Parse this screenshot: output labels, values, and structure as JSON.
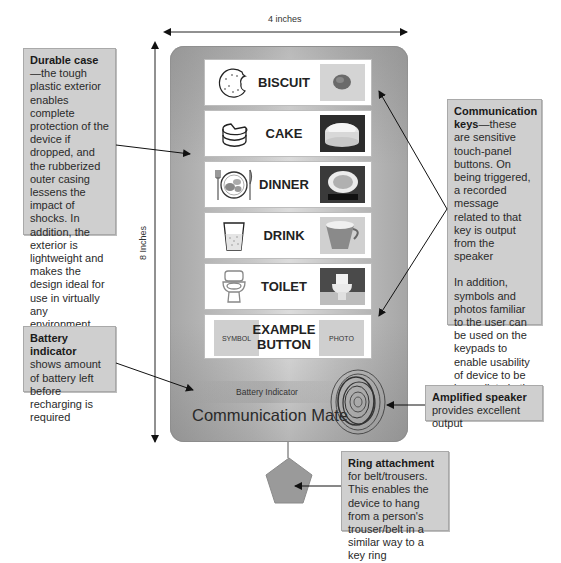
{
  "dimensions": {
    "width_label": "4 inches",
    "height_label": "8 Inches"
  },
  "device": {
    "name": "Communication Mate",
    "battery_label": "Battery Indicator",
    "keys": [
      {
        "label": "BISCUIT",
        "symbol": "biscuit-symbol",
        "photo": "biscuit-photo"
      },
      {
        "label": "CAKE",
        "symbol": "cake-symbol",
        "photo": "cake-photo"
      },
      {
        "label": "DINNER",
        "symbol": "dinner-symbol",
        "photo": "dinner-photo"
      },
      {
        "label": "DRINK",
        "symbol": "drink-symbol",
        "photo": "cup-photo"
      },
      {
        "label": "TOILET",
        "symbol": "toilet-symbol",
        "photo": "toilet-photo"
      },
      {
        "label_line1": "EXAMPLE",
        "label_line2": "BUTTON",
        "symbol_box": "SYMBOL",
        "photo_box": "PHOTO"
      }
    ]
  },
  "callouts": {
    "durable_case": {
      "title": "Durable case",
      "text": "—the tough plastic exterior enables complete protection of the device if dropped, and the rubberized outer casing lessens the impact of shocks. In addition, the exterior is lightweight and makes the design ideal for use in virtually any environment"
    },
    "battery_indicator": {
      "title": "Battery indicator",
      "text": " shows amount of battery left before recharging is required"
    },
    "communication_keys": {
      "title": "Communication keys",
      "text": "—these are sensitive touch-panel buttons. On being triggered, a recorded message related to that key is output from the speaker",
      "text2": "In addition, symbols and photos familiar to the user can be used on the keypads to enable usability of device to be immediate in the case of some individuals"
    },
    "amplified_speaker": {
      "title": "Amplified speaker",
      "text": "provides excellent output"
    },
    "ring_attachment": {
      "title": "Ring attachment",
      "text": " for belt/trousers. This enables the device to hang from a person's trouser/belt in a similar way to a key ring"
    }
  },
  "colors": {
    "device_gray": "#b8b8b8",
    "callout_bg": "#cfcfcf",
    "key_bg": "#ffffff",
    "pentagon": "#9a9a9a"
  }
}
